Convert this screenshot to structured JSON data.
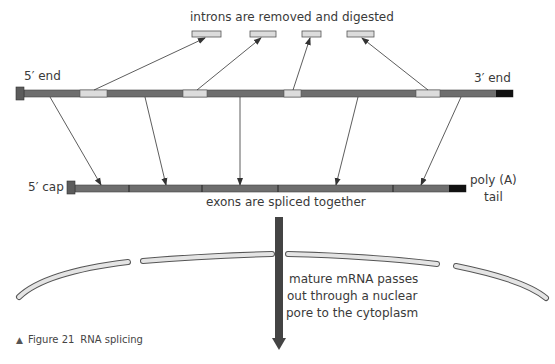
{
  "title": "RNA splicing",
  "labels": {
    "introns_removed": "introns are removed and digested",
    "five_prime_end": "5′ end",
    "three_prime_end": "3′ end",
    "five_prime_cap": "5′ cap",
    "poly_a_line1": "poly (A)",
    "poly_a_line2": "tail",
    "exons_spliced": "exons are spliced together",
    "export_line1": "mature mRNA passes",
    "export_line2": "out through a nuclear",
    "export_line3": "pore to the cytoplasm"
  },
  "caption": {
    "marker": "▲",
    "figure": "Figure 21",
    "text": "RNA splicing"
  },
  "colors": {
    "exon": "#6e6e6e",
    "intron": "#dcdcdc",
    "cap": "#5c5c5c",
    "poly_a": "#111111",
    "membrane_fill": "#e4e4e4",
    "membrane_stroke": "#555555",
    "arrow": "#444444"
  }
}
